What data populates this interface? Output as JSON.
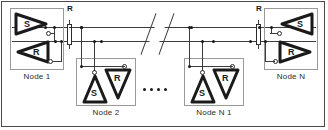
{
  "figure": {
    "type": "differential-bus-network-diagram"
  },
  "bus": {
    "line_count": 2,
    "break_symbol": "double-slash",
    "ellipsis_dots": 4
  },
  "terminations": [
    {
      "id": "left",
      "label": "R"
    },
    {
      "id": "right",
      "label": "R"
    }
  ],
  "nodes": [
    {
      "id": "node1",
      "label": "Node 1",
      "sender": {
        "letter": "S",
        "direction": "right"
      },
      "receiver": {
        "letter": "R",
        "direction": "left"
      }
    },
    {
      "id": "node2",
      "label": "Node 2",
      "sender": {
        "letter": "S",
        "direction": "up"
      },
      "receiver": {
        "letter": "R",
        "direction": "down"
      }
    },
    {
      "id": "nodeN1",
      "label": "Node N 1",
      "sender": {
        "letter": "S",
        "direction": "up"
      },
      "receiver": {
        "letter": "R",
        "direction": "down"
      }
    },
    {
      "id": "nodeN",
      "label": "Node N",
      "sender": {
        "letter": "S",
        "direction": "left"
      },
      "receiver": {
        "letter": "R",
        "direction": "right"
      }
    }
  ],
  "colors": {
    "wire": "#3c3c3c",
    "outline": "#1a1a1a",
    "box_border": "#9a9a9a",
    "frame": "#4a4a4a",
    "background": "#ffffff",
    "text": "#2b2b2b"
  }
}
